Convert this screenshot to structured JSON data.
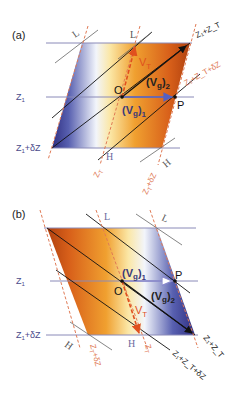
{
  "panels": [
    {
      "id": "a",
      "label": "(a)",
      "labels": {
        "z1": "Z",
        "z1_sub": "1",
        "z1dz": "Z",
        "z1dz_sub": "1",
        "z1dz_rest": "+δZ",
        "O": "O",
        "P": "P",
        "vg1": "(V",
        "vg1_g": "g",
        "vg1_end": ")",
        "vg1_sub": "1",
        "vg2": "(V",
        "vg2_g": "g",
        "vg2_end": ")",
        "vg2_sub": "2",
        "vt": "V",
        "vt_sub": "T",
        "L1": "L",
        "L2": "L",
        "H1": "H",
        "H2": "H",
        "zT": "Z",
        "zT_sub": "T",
        "zTdz": "Z",
        "zTdz_sub": "T",
        "zTdz_rest": "+δZ",
        "z1zT": "Z₁+Z_T",
        "z1zTdz": "Z₁+Z_T+δZ"
      }
    },
    {
      "id": "b",
      "label": "(b)",
      "labels": {
        "z1": "Z",
        "z1_sub": "1",
        "z1dz": "Z",
        "z1dz_sub": "1",
        "z1dz_rest": "+δZ",
        "O": "O",
        "P": "P",
        "vg1": "(V",
        "vg1_g": "g",
        "vg1_end": ")",
        "vg1_sub": "1",
        "vg2": "(V",
        "vg2_g": "g",
        "vg2_end": ")",
        "vg2_sub": "2",
        "vt": "V",
        "vt_sub": "T",
        "L1": "L",
        "L2": "L",
        "H1": "H",
        "H2": "H",
        "zT": "Z",
        "zT_sub": "T",
        "zTdz": "Z",
        "zTdz_sub": "T",
        "zTdz_rest": "+δZ",
        "z1zT": "Z₁+Z_T",
        "z1zTdz": "Z₁+Z_T+δZ"
      }
    }
  ],
  "colors": {
    "cold": "#3b3a8e",
    "warm": "#c8480e",
    "light": "#f4f6fb",
    "thermal_wind": "#e0501e",
    "isotherm_dashed": "#e07a55",
    "contour_label": "#4a4a8a",
    "geostrophic_wind": "#5560c0",
    "black": "#111111"
  }
}
